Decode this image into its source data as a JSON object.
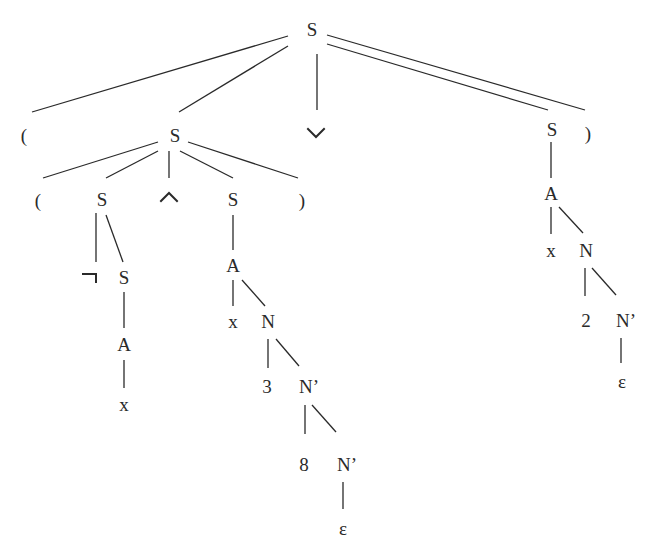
{
  "diagram": {
    "type": "parse-tree",
    "nodes": [
      {
        "id": "n0",
        "label": "S",
        "x": 312,
        "y": 29
      },
      {
        "id": "n1",
        "label": "(",
        "x": 24,
        "y": 135
      },
      {
        "id": "n2",
        "label": "S",
        "x": 175,
        "y": 135
      },
      {
        "id": "n3",
        "label": "∨",
        "x": 316,
        "y": 133,
        "symbol": "or"
      },
      {
        "id": "n4",
        "label": "S",
        "x": 552,
        "y": 129
      },
      {
        "id": "n5",
        "label": ")",
        "x": 588,
        "y": 133
      },
      {
        "id": "n6",
        "label": "(",
        "x": 38,
        "y": 200
      },
      {
        "id": "n7",
        "label": "S",
        "x": 102,
        "y": 199
      },
      {
        "id": "n8",
        "label": "∧",
        "x": 169,
        "y": 197,
        "symbol": "and"
      },
      {
        "id": "n9",
        "label": "S",
        "x": 233,
        "y": 199
      },
      {
        "id": "n10",
        "label": ")",
        "x": 302,
        "y": 200
      },
      {
        "id": "n11",
        "label": "¬",
        "x": 93,
        "y": 277,
        "symbol": "not"
      },
      {
        "id": "n12",
        "label": "S",
        "x": 124,
        "y": 277
      },
      {
        "id": "n13",
        "label": "A",
        "x": 124,
        "y": 344
      },
      {
        "id": "n14",
        "label": "x",
        "x": 124,
        "y": 404
      },
      {
        "id": "n15",
        "label": "A",
        "x": 233,
        "y": 265
      },
      {
        "id": "n16",
        "label": "x",
        "x": 233,
        "y": 321
      },
      {
        "id": "n17",
        "label": "N",
        "x": 268,
        "y": 321
      },
      {
        "id": "n18",
        "label": "3",
        "x": 267,
        "y": 386
      },
      {
        "id": "n19",
        "label": "N’",
        "x": 309,
        "y": 386
      },
      {
        "id": "n20",
        "label": "8",
        "x": 304,
        "y": 464
      },
      {
        "id": "n21",
        "label": "N’",
        "x": 347,
        "y": 464
      },
      {
        "id": "n22",
        "label": "ε",
        "x": 343,
        "y": 528
      },
      {
        "id": "n23",
        "label": "A",
        "x": 551,
        "y": 193
      },
      {
        "id": "n24",
        "label": "x",
        "x": 551,
        "y": 250
      },
      {
        "id": "n25",
        "label": "N",
        "x": 586,
        "y": 250
      },
      {
        "id": "n26",
        "label": "2",
        "x": 586,
        "y": 320
      },
      {
        "id": "n27",
        "label": "N’",
        "x": 626,
        "y": 320
      },
      {
        "id": "n28",
        "label": "ε",
        "x": 622,
        "y": 381
      }
    ],
    "edges": [
      {
        "from": "n0",
        "to": "n1",
        "x1": 288,
        "y1": 36,
        "x2": 32,
        "y2": 112
      },
      {
        "from": "n0",
        "to": "n2",
        "x1": 288,
        "y1": 46,
        "x2": 179,
        "y2": 112
      },
      {
        "from": "n0",
        "to": "n3",
        "x1": 317,
        "y1": 54,
        "x2": 317,
        "y2": 110
      },
      {
        "from": "n0",
        "to": "n4",
        "x1": 327,
        "y1": 44,
        "x2": 548,
        "y2": 110
      },
      {
        "from": "n0",
        "to": "n5",
        "x1": 327,
        "y1": 35,
        "x2": 585,
        "y2": 110
      },
      {
        "from": "n2",
        "to": "n6",
        "x1": 158,
        "y1": 142,
        "x2": 43,
        "y2": 178
      },
      {
        "from": "n2",
        "to": "n7",
        "x1": 158,
        "y1": 151,
        "x2": 106,
        "y2": 178
      },
      {
        "from": "n2",
        "to": "n8",
        "x1": 169,
        "y1": 151,
        "x2": 169,
        "y2": 178
      },
      {
        "from": "n2",
        "to": "n9",
        "x1": 180,
        "y1": 151,
        "x2": 233,
        "y2": 178
      },
      {
        "from": "n2",
        "to": "n10",
        "x1": 188,
        "y1": 142,
        "x2": 298,
        "y2": 178
      },
      {
        "from": "n7",
        "to": "n11",
        "x1": 96,
        "y1": 213,
        "x2": 96,
        "y2": 262
      },
      {
        "from": "n7",
        "to": "n12",
        "x1": 106,
        "y1": 215,
        "x2": 123,
        "y2": 262
      },
      {
        "from": "n12",
        "to": "n13",
        "x1": 124,
        "y1": 292,
        "x2": 124,
        "y2": 328
      },
      {
        "from": "n13",
        "to": "n14",
        "x1": 124,
        "y1": 360,
        "x2": 124,
        "y2": 388
      },
      {
        "from": "n9",
        "to": "n15",
        "x1": 233,
        "y1": 215,
        "x2": 233,
        "y2": 250
      },
      {
        "from": "n15",
        "to": "n16",
        "x1": 233,
        "y1": 280,
        "x2": 233,
        "y2": 306
      },
      {
        "from": "n15",
        "to": "n17",
        "x1": 242,
        "y1": 280,
        "x2": 265,
        "y2": 306
      },
      {
        "from": "n17",
        "to": "n18",
        "x1": 268,
        "y1": 339,
        "x2": 268,
        "y2": 368
      },
      {
        "from": "n17",
        "to": "n19",
        "x1": 276,
        "y1": 339,
        "x2": 299,
        "y2": 366
      },
      {
        "from": "n19",
        "to": "n20",
        "x1": 305,
        "y1": 405,
        "x2": 305,
        "y2": 434
      },
      {
        "from": "n19",
        "to": "n21",
        "x1": 312,
        "y1": 405,
        "x2": 336,
        "y2": 432
      },
      {
        "from": "n21",
        "to": "n22",
        "x1": 343,
        "y1": 482,
        "x2": 343,
        "y2": 509
      },
      {
        "from": "n4",
        "to": "n23",
        "x1": 551,
        "y1": 142,
        "x2": 551,
        "y2": 178
      },
      {
        "from": "n23",
        "to": "n24",
        "x1": 551,
        "y1": 207,
        "x2": 551,
        "y2": 234
      },
      {
        "from": "n23",
        "to": "n25",
        "x1": 559,
        "y1": 207,
        "x2": 583,
        "y2": 233
      },
      {
        "from": "n25",
        "to": "n26",
        "x1": 585,
        "y1": 268,
        "x2": 585,
        "y2": 296
      },
      {
        "from": "n25",
        "to": "n27",
        "x1": 592,
        "y1": 268,
        "x2": 616,
        "y2": 295
      },
      {
        "from": "n27",
        "to": "n28",
        "x1": 621,
        "y1": 338,
        "x2": 621,
        "y2": 363
      }
    ]
  }
}
